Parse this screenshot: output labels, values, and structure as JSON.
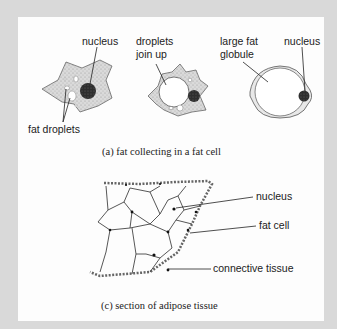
{
  "figure": {
    "part_a": {
      "caption": "(a)  fat collecting in a fat cell",
      "labels": {
        "nucleus_1": "nucleus",
        "fat_droplets": "fat droplets",
        "droplets_join_line1": "droplets",
        "droplets_join_line2": "join up",
        "large_fat_line1": "large fat",
        "large_fat_line2": "globule",
        "nucleus_2": "nucleus"
      }
    },
    "part_c": {
      "caption": "(c)  section of adipose tissue",
      "labels": {
        "nucleus": "nucleus",
        "fat_cell": "fat cell",
        "connective_tissue": "connective tissue"
      }
    }
  },
  "colors": {
    "frame": "#d9d9d9",
    "panel": "#fdfdfd",
    "cytoplasm": "#d4d4d4",
    "nucleus": "#333333",
    "ink": "#222222"
  }
}
